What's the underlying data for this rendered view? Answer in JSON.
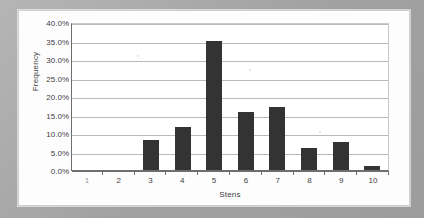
{
  "chart_data": {
    "type": "bar",
    "title": "",
    "xlabel": "Stens",
    "ylabel": "Frequency",
    "categories": [
      "1",
      "2",
      "3",
      "4",
      "5",
      "6",
      "7",
      "8",
      "9",
      "10"
    ],
    "values": [
      0.0,
      0.0,
      8.2,
      11.5,
      35.0,
      15.7,
      17.0,
      6.0,
      7.7,
      1.0
    ],
    "value_labels": [
      "0.0%",
      "0.0%",
      "8.2%",
      "11.5%",
      "35.0%",
      "15.7%",
      "17.0%",
      "6.0%",
      "7.7%",
      "1.0%"
    ],
    "ylim": [
      0,
      40
    ],
    "ytick_values": [
      40,
      35,
      30,
      25,
      20,
      15,
      10,
      5,
      0
    ],
    "ytick_labels": [
      "40.0%",
      "35.0%",
      "30.0%",
      "25.0%",
      "20.0%",
      "15.0%",
      "10.0%",
      "5.0%",
      "0.0%"
    ],
    "grid": true,
    "legend": false,
    "legend_position": "none",
    "series": [
      {
        "name": "Frequency",
        "color": "#333333",
        "values": [
          0.0,
          0.0,
          8.2,
          11.5,
          35.0,
          15.7,
          17.0,
          6.0,
          7.7,
          1.0
        ]
      }
    ]
  },
  "colors": {
    "bar": "#333333",
    "gridline": "#b9b9b9",
    "axis": "#6e6e6e",
    "plot_background": "#ffffff",
    "card_background": "#fdfdfd",
    "page_background": "#a8a8a8",
    "text": "#3d3d3d"
  }
}
